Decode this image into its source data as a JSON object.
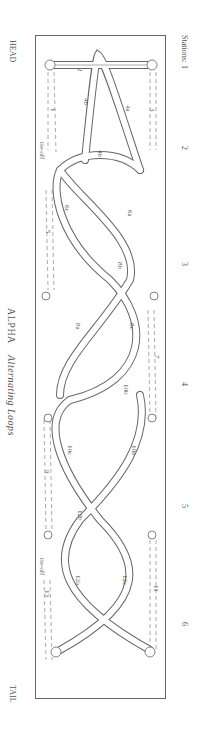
{
  "labels": {
    "head": "HEAD",
    "tail": "TAIL",
    "title_main": "ALPHA",
    "title_sub": "Alternating Loops",
    "stations_prefix": "Stations:",
    "stations": [
      "1",
      "2",
      "3",
      "4",
      "5",
      "6"
    ]
  },
  "segments": [
    "1",
    "2",
    "3",
    "4a",
    "4b",
    "4b",
    "tie-off",
    "5",
    "6a",
    "6c",
    "7",
    "8a",
    "8b",
    "8c",
    "9",
    "10a",
    "10b",
    "10c",
    "11",
    "12a",
    "12b",
    "12c",
    "13",
    "tie-off"
  ],
  "colors": {
    "line": "#666666",
    "fill": "#ffffff",
    "text": "#555555"
  }
}
